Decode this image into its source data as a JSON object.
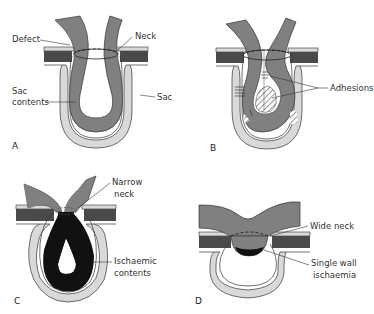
{
  "colors": {
    "wall_dark": "#4a4a4a",
    "sac_light": "#d9d9d9",
    "bowel": "#808080",
    "ischaemic": "#111111",
    "outline": "#333333"
  },
  "panels": [
    {
      "letter": "A",
      "labels": {
        "defect": "Defect",
        "neck": "Neck",
        "sac_contents_1": "Sac",
        "sac_contents_2": "contents",
        "sac": "Sac"
      }
    },
    {
      "letter": "B",
      "labels": {
        "adhesions": "Adhesions"
      }
    },
    {
      "letter": "C",
      "labels": {
        "narrow_neck_1": "Narrow",
        "narrow_neck_2": "neck",
        "ischaemic_1": "Ischaemic",
        "ischaemic_2": "contents"
      }
    },
    {
      "letter": "D",
      "labels": {
        "wide_neck": "Wide neck",
        "single_wall_1": "Single wall",
        "single_wall_2": "ischaemia"
      }
    }
  ]
}
